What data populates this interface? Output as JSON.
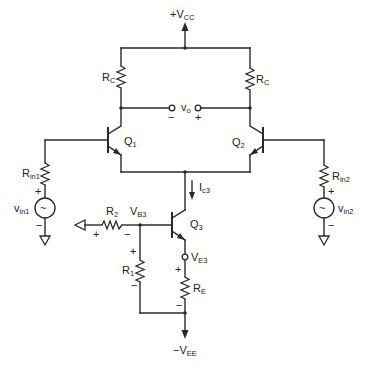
{
  "diagram": {
    "type": "circuit-schematic",
    "supplies": {
      "positive": "+V",
      "positive_sub": "CC",
      "negative": "−V",
      "negative_sub": "EE"
    },
    "transistors": [
      {
        "id": "Q1",
        "label": "Q",
        "sub": "1"
      },
      {
        "id": "Q2",
        "label": "Q",
        "sub": "2"
      },
      {
        "id": "Q3",
        "label": "Q",
        "sub": "3"
      }
    ],
    "resistors": {
      "rc_left": {
        "label": "R",
        "sub": "C"
      },
      "rc_right": {
        "label": "R",
        "sub": "C"
      },
      "rin1": {
        "label": "R",
        "sub": "in1"
      },
      "rin2": {
        "label": "R",
        "sub": "in2"
      },
      "r1": {
        "label": "R",
        "sub": "1",
        "plus": "+",
        "minus": "−"
      },
      "r2": {
        "label": "R",
        "sub": "2",
        "plus": "+",
        "minus": "−"
      },
      "re": {
        "label": "R",
        "sub": "E",
        "plus": "+",
        "minus": "−"
      }
    },
    "sources": {
      "vin1": {
        "label": "v",
        "sub": "in1",
        "symbol": "~",
        "plus": "+",
        "minus": "−"
      },
      "vin2": {
        "label": "v",
        "sub": "in2",
        "symbol": "~",
        "plus": "+",
        "minus": "−"
      }
    },
    "output": {
      "label": "v",
      "sub": "o",
      "minus": "−",
      "plus": "+"
    },
    "nodes": {
      "vb3": {
        "label": "V",
        "sub": "B3"
      },
      "ve3": {
        "label": "V",
        "sub": "E3"
      }
    },
    "current": {
      "label": "I",
      "sub": "c3"
    }
  }
}
